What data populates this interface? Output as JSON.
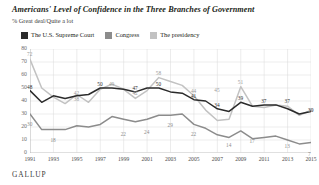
{
  "header": {
    "title": "Americans' Level of Confidence in the Three Branches of Government",
    "subtitle": "% Great deal/Quite a lot"
  },
  "source": {
    "label": "GALLUP"
  },
  "legend": [
    {
      "label": "The U.S. Supreme Court",
      "color": "#2b2b2b"
    },
    {
      "label": "Congress",
      "color": "#8c8c8c"
    },
    {
      "label": "The presidency",
      "color": "#c2c2c2"
    }
  ],
  "chart_data": {
    "type": "line",
    "title": "Americans' Level of Confidence in the Three Branches of Government",
    "subtitle": "% Great deal/Quite a lot",
    "xlabel": "",
    "ylabel": "",
    "ylim": [
      0,
      80
    ],
    "yticks": [
      0,
      10,
      20,
      30,
      40,
      50,
      60,
      70,
      80
    ],
    "grid": true,
    "legend_position": "top-left",
    "x": [
      1991,
      1992,
      1993,
      1994,
      1995,
      1996,
      1997,
      1998,
      1999,
      2000,
      2001,
      2002,
      2003,
      2004,
      2005,
      2006,
      2007,
      2008,
      2009,
      2010,
      2011,
      2012,
      2013,
      2014,
      2015
    ],
    "xticks": [
      "1991",
      "1993",
      "1995",
      "1997",
      "1999",
      "2001",
      "2003",
      "2005",
      "2007",
      "2009",
      "2011",
      "2013",
      "2015"
    ],
    "series": [
      {
        "name": "The U.S. Supreme Court",
        "color": "#2b2b2b",
        "values": [
          48,
          39,
          44,
          42,
          44,
          45,
          50,
          50,
          49,
          47,
          50,
          50,
          47,
          46,
          41,
          40,
          34,
          32,
          39,
          36,
          37,
          37,
          34,
          30,
          32
        ],
        "labels": [
          {
            "x": 1991,
            "v": 48
          },
          {
            "x": 1997,
            "v": 50
          },
          {
            "x": 2000,
            "v": 47
          },
          {
            "x": 2002,
            "v": 50
          },
          {
            "x": 2005,
            "v": 41
          },
          {
            "x": 2007,
            "v": 34
          },
          {
            "x": 2009,
            "v": 39
          },
          {
            "x": 2011,
            "v": 37
          },
          {
            "x": 2013,
            "v": 37
          },
          {
            "x": 2015,
            "v": 30
          }
        ]
      },
      {
        "name": "Congress",
        "color": "#8c8c8c",
        "values": [
          30,
          18,
          18,
          18,
          21,
          20,
          22,
          28,
          26,
          24,
          26,
          29,
          29,
          30,
          22,
          19,
          14,
          12,
          17,
          11,
          12,
          13,
          10,
          7,
          8
        ],
        "labels": [
          {
            "x": 1991,
            "v": 30
          },
          {
            "x": 1993,
            "v": 18
          },
          {
            "x": 1999,
            "v": 22
          },
          {
            "x": 2001,
            "v": 24
          },
          {
            "x": 2003,
            "v": 29
          },
          {
            "x": 2005,
            "v": 22
          },
          {
            "x": 2008,
            "v": 14
          },
          {
            "x": 2010,
            "v": 17
          },
          {
            "x": 2013,
            "v": 13
          },
          {
            "x": 2015,
            "v": 7
          }
        ]
      },
      {
        "name": "The presidency",
        "color": "#c2c2c2",
        "values": [
          72,
          50,
          43,
          38,
          45,
          39,
          49,
          53,
          49,
          42,
          48,
          58,
          55,
          52,
          44,
          33,
          25,
          26,
          51,
          36,
          35,
          37,
          36,
          29,
          33
        ],
        "labels": [
          {
            "x": 1991,
            "v": 72
          },
          {
            "x": 1995,
            "v": 38
          },
          {
            "x": 1995,
            "v": 42
          },
          {
            "x": 1998,
            "v": 49
          },
          {
            "x": 2000,
            "v": 42
          },
          {
            "x": 2002,
            "v": 58
          },
          {
            "x": 2005,
            "v": 44
          },
          {
            "x": 2007,
            "v": 45
          },
          {
            "x": 2009,
            "v": 51
          },
          {
            "x": 2015,
            "v": 29
          }
        ]
      }
    ],
    "annotations": [
      {
        "text": "72",
        "series": "The presidency",
        "x": 1991
      },
      {
        "text": "48",
        "series": "The U.S. Supreme Court",
        "x": 1991
      },
      {
        "text": "30",
        "series": "Congress",
        "x": 1991
      },
      {
        "text": "42",
        "series": "The U.S. Supreme Court",
        "x": 1994
      },
      {
        "text": "38",
        "series": "The presidency",
        "x": 1996
      },
      {
        "text": "18",
        "series": "Congress",
        "x": 1994
      },
      {
        "text": "50",
        "series": "The U.S. Supreme Court",
        "x": 1997
      },
      {
        "text": "49",
        "series": "The presidency",
        "x": 1998
      },
      {
        "text": "22",
        "series": "Congress",
        "x": 1999
      },
      {
        "text": "47",
        "series": "The U.S. Supreme Court",
        "x": 2000
      },
      {
        "text": "42",
        "series": "The presidency",
        "x": 2000
      },
      {
        "text": "24",
        "series": "Congress",
        "x": 2001
      },
      {
        "text": "58",
        "series": "The presidency",
        "x": 2002
      },
      {
        "text": "50",
        "series": "The U.S. Supreme Court",
        "x": 2002
      },
      {
        "text": "29",
        "series": "Congress",
        "x": 2003
      },
      {
        "text": "44",
        "series": "The presidency",
        "x": 2005
      },
      {
        "text": "41",
        "series": "The U.S. Supreme Court",
        "x": 2005
      },
      {
        "text": "22",
        "series": "Congress",
        "x": 2005
      },
      {
        "text": "34",
        "series": "The U.S. Supreme Court",
        "x": 2007
      },
      {
        "text": "45",
        "series": "The presidency",
        "x": 2007
      },
      {
        "text": "14",
        "series": "Congress",
        "x": 2008
      },
      {
        "text": "51",
        "series": "The presidency",
        "x": 2009
      },
      {
        "text": "39",
        "series": "The U.S. Supreme Court",
        "x": 2009
      },
      {
        "text": "17",
        "series": "Congress",
        "x": 2010
      },
      {
        "text": "37",
        "series": "The U.S. Supreme Court",
        "x": 2011
      },
      {
        "text": "37",
        "series": "The U.S. Supreme Court",
        "x": 2013
      },
      {
        "text": "13",
        "series": "Congress",
        "x": 2013
      },
      {
        "text": "30",
        "series": "The U.S. Supreme Court",
        "x": 2015
      },
      {
        "text": "29",
        "series": "The presidency",
        "x": 2015
      },
      {
        "text": "7",
        "series": "Congress",
        "x": 2015
      }
    ]
  }
}
